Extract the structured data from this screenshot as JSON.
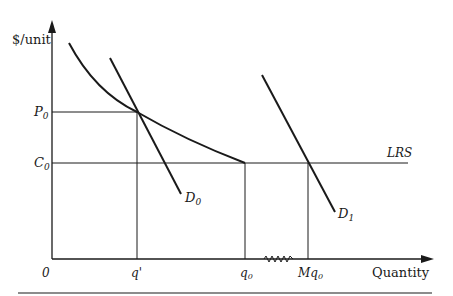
{
  "diagram": {
    "y_axis_label": "$/unit",
    "x_axis_label": "Quantity",
    "origin_label": "0",
    "price_labels": {
      "p0": "P",
      "p0_sub": "0",
      "c0": "C",
      "c0_sub": "0"
    },
    "quantity_labels": {
      "q_prime": "q'",
      "q0": "q",
      "q0_sub": "0",
      "mq0": "Mq",
      "mq0_sub": "0"
    },
    "curve_labels": {
      "lrs": "LRS",
      "d0": "D",
      "d0_sub": "0",
      "d1": "D",
      "d1_sub": "1"
    },
    "colors": {
      "line": "#1a1a1a",
      "background": "#ffffff"
    }
  }
}
